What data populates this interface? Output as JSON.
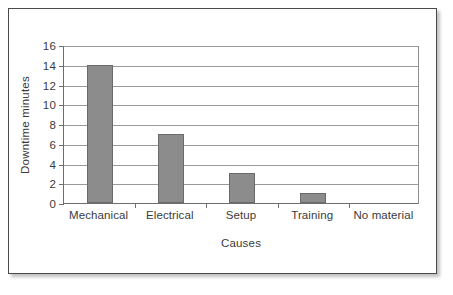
{
  "chart_data": {
    "type": "bar",
    "title": "",
    "xlabel": "Causes",
    "ylabel": "Downtime minutes",
    "categories": [
      "Mechanical",
      "Electrical",
      "Setup",
      "Training",
      "No material"
    ],
    "values": [
      14,
      7,
      3,
      1,
      0
    ],
    "series": [
      {
        "name": "Downtime minutes",
        "values": [
          14,
          7,
          3,
          1,
          0
        ]
      }
    ],
    "ylim": [
      0,
      16
    ],
    "ytick_step": 2,
    "yticks": [
      0,
      2,
      4,
      6,
      8,
      10,
      12,
      14,
      16
    ],
    "ytick_labels": [
      "0",
      "2",
      "4",
      "6",
      "8",
      "10",
      "12",
      "14",
      "16"
    ],
    "grid": true,
    "grid_axis": "y",
    "legend": false,
    "legend_position": "none",
    "bar_color": "#8c8c8c",
    "bar_edge_color": "#6a6a6a",
    "grid_color": "#9a9a9a",
    "axis_color": "#6e6e6e",
    "text_color": "#3b3b3b",
    "frame_color": "#4a4a4a",
    "background": "#ffffff"
  }
}
